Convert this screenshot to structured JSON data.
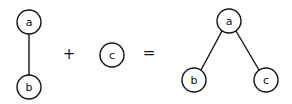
{
  "diagram": {
    "operator_plus": "+",
    "operator_equals": "=",
    "left_tree": {
      "nodes": [
        {
          "id": "a",
          "label": "a",
          "x": 29,
          "y": 22
        },
        {
          "id": "b",
          "label": "b",
          "x": 29,
          "y": 87
        }
      ],
      "edges": [
        [
          "a",
          "b"
        ]
      ]
    },
    "middle_tree": {
      "nodes": [
        {
          "id": "c",
          "label": "c",
          "x": 112,
          "y": 55
        }
      ],
      "edges": []
    },
    "result_tree": {
      "nodes": [
        {
          "id": "a",
          "label": "a",
          "x": 229,
          "y": 21
        },
        {
          "id": "b",
          "label": "b",
          "x": 194,
          "y": 80
        },
        {
          "id": "c",
          "label": "c",
          "x": 266,
          "y": 80
        }
      ],
      "edges": [
        [
          "a",
          "b"
        ],
        [
          "a",
          "c"
        ]
      ]
    }
  }
}
